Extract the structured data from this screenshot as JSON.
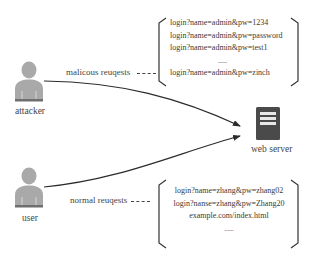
{
  "actors": {
    "attacker": {
      "label": "attacker"
    },
    "user": {
      "label": "user"
    }
  },
  "server": {
    "label": "web server",
    "icon": "server-icon"
  },
  "malicious": {
    "label": "malicous reuqests",
    "requests": [
      "login?name=admin&pw=1234",
      "login?name=admin&pw=password",
      "login?name=admin&pw=test1",
      "......",
      "login?name=admin&pw=zinch"
    ]
  },
  "normal": {
    "label": "normal reuqests",
    "requests": [
      "login?name=zhang&pw=zhang02",
      "login?nanse=zhang&pw=Zhang20",
      "example.com/index.html",
      "......"
    ]
  },
  "colors": {
    "person_fill": "#a9a9a9",
    "person_base": "#6e6e6e",
    "server_fill": "#4a4a4a",
    "line": "#2b2b2b",
    "text": "#3a3a3a"
  }
}
